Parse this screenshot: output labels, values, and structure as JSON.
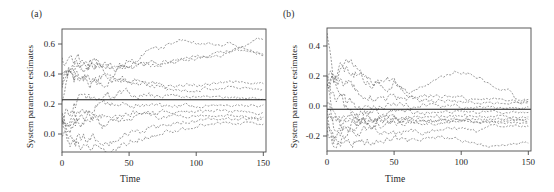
{
  "figure": {
    "background": "#ffffff",
    "trajectory_color": "#5a5a5a",
    "reference_color": "#161616",
    "axis_color": "#4a4a4a"
  },
  "panels": [
    {
      "tag": "(a)",
      "xlabel": "Time",
      "ylabel": "System parameter estimates",
      "xticks": [
        "0",
        "50",
        "100",
        "150"
      ],
      "yticks": [
        "0.0",
        "0.2",
        "0.4",
        "0.6"
      ]
    },
    {
      "tag": "(b)",
      "xlabel": "Time",
      "ylabel": "System parameter estimates",
      "xticks": [
        "0",
        "50",
        "100",
        "150"
      ],
      "yticks": [
        "-0.2",
        "0.0",
        "0.2",
        "0.4"
      ]
    }
  ],
  "chart_data": [
    {
      "type": "line",
      "panel": "(a)",
      "title": "",
      "xlabel": "Time",
      "ylabel": "System parameter estimates",
      "xlim": [
        0,
        152
      ],
      "ylim": [
        -0.12,
        0.7
      ],
      "xticks": [
        0,
        50,
        100,
        150
      ],
      "yticks": [
        0.0,
        0.2,
        0.4,
        0.6
      ],
      "grid": false,
      "legend": "none",
      "reference_line": {
        "style": "solid",
        "orientation": "horizontal",
        "value": 0.228,
        "label": "true system parameter"
      },
      "x": [
        0,
        5,
        10,
        15,
        20,
        25,
        30,
        35,
        40,
        45,
        50,
        55,
        60,
        65,
        70,
        75,
        80,
        85,
        90,
        95,
        100,
        105,
        110,
        115,
        120,
        125,
        130,
        135,
        140,
        145,
        150
      ],
      "series": [
        {
          "name": "estimate-1",
          "style": "dashed",
          "values": [
            0.34,
            0.42,
            0.47,
            0.47,
            0.44,
            0.46,
            0.47,
            0.44,
            0.44,
            0.47,
            0.49,
            0.48,
            0.53,
            0.57,
            0.57,
            0.58,
            0.6,
            0.62,
            0.63,
            0.63,
            0.61,
            0.6,
            0.6,
            0.6,
            0.6,
            0.61,
            0.59,
            0.58,
            0.6,
            0.63,
            0.63
          ]
        },
        {
          "name": "estimate-2",
          "style": "dashed",
          "values": [
            0.52,
            0.51,
            0.5,
            0.5,
            0.47,
            0.47,
            0.46,
            0.45,
            0.45,
            0.46,
            0.45,
            0.45,
            0.46,
            0.46,
            0.46,
            0.47,
            0.48,
            0.48,
            0.49,
            0.5,
            0.5,
            0.51,
            0.52,
            0.52,
            0.53,
            0.54,
            0.55,
            0.55,
            0.55,
            0.54,
            0.53
          ]
        },
        {
          "name": "estimate-3",
          "style": "dashed",
          "values": [
            0.22,
            0.44,
            0.43,
            0.43,
            0.42,
            0.44,
            0.42,
            0.4,
            0.42,
            0.44,
            0.45,
            0.46,
            0.46,
            0.47,
            0.47,
            0.48,
            0.48,
            0.49,
            0.5,
            0.51,
            0.52,
            0.52,
            0.53,
            0.54,
            0.55,
            0.56,
            0.57,
            0.57,
            0.55,
            0.54,
            0.53
          ]
        },
        {
          "name": "estimate-4",
          "style": "dashed",
          "values": [
            0.4,
            0.41,
            0.4,
            0.39,
            0.38,
            0.37,
            0.38,
            0.37,
            0.36,
            0.35,
            0.35,
            0.34,
            0.34,
            0.34,
            0.33,
            0.33,
            0.32,
            0.32,
            0.32,
            0.33,
            0.33,
            0.33,
            0.33,
            0.34,
            0.34,
            0.35,
            0.35,
            0.35,
            0.34,
            0.34,
            0.34
          ]
        },
        {
          "name": "estimate-5",
          "style": "dashed",
          "values": [
            0.3,
            0.35,
            0.36,
            0.36,
            0.35,
            0.34,
            0.34,
            0.35,
            0.36,
            0.37,
            0.36,
            0.35,
            0.34,
            0.33,
            0.32,
            0.31,
            0.3,
            0.3,
            0.29,
            0.29,
            0.29,
            0.3,
            0.3,
            0.3,
            0.3,
            0.31,
            0.31,
            0.31,
            0.3,
            0.3,
            0.29
          ]
        },
        {
          "name": "estimate-6",
          "style": "dashed",
          "values": [
            0.08,
            0.14,
            0.2,
            0.23,
            0.24,
            0.25,
            0.26,
            0.26,
            0.26,
            0.27,
            0.27,
            0.26,
            0.26,
            0.26,
            0.25,
            0.25,
            0.25,
            0.25,
            0.25,
            0.25,
            0.25,
            0.25,
            0.25,
            0.25,
            0.24,
            0.24,
            0.24,
            0.24,
            0.24,
            0.24,
            0.24
          ]
        },
        {
          "name": "estimate-7",
          "style": "dashed",
          "values": [
            0.12,
            0.1,
            0.12,
            0.14,
            0.17,
            0.19,
            0.2,
            0.2,
            0.2,
            0.2,
            0.19,
            0.19,
            0.19,
            0.19,
            0.19,
            0.19,
            0.19,
            0.19,
            0.19,
            0.19,
            0.19,
            0.19,
            0.19,
            0.19,
            0.19,
            0.19,
            0.19,
            0.19,
            0.19,
            0.19,
            0.19
          ]
        },
        {
          "name": "estimate-8",
          "style": "dashed",
          "values": [
            0.05,
            0.07,
            0.08,
            0.09,
            0.11,
            0.12,
            0.12,
            0.11,
            0.11,
            0.12,
            0.13,
            0.14,
            0.14,
            0.14,
            0.14,
            0.15,
            0.15,
            0.15,
            0.15,
            0.15,
            0.15,
            0.15,
            0.15,
            0.15,
            0.15,
            0.15,
            0.15,
            0.15,
            0.15,
            0.14,
            0.14
          ]
        },
        {
          "name": "estimate-9",
          "style": "dashed",
          "values": [
            0.1,
            0.05,
            0.08,
            0.09,
            0.1,
            0.11,
            0.06,
            0.08,
            0.09,
            0.1,
            0.11,
            0.11,
            0.12,
            0.12,
            0.12,
            0.12,
            0.12,
            0.12,
            0.12,
            0.12,
            0.12,
            0.12,
            0.12,
            0.12,
            0.12,
            0.12,
            0.12,
            0.12,
            0.11,
            0.11,
            0.11
          ]
        },
        {
          "name": "estimate-10",
          "style": "dashed",
          "values": [
            0.06,
            -0.04,
            -0.05,
            -0.04,
            -0.03,
            -0.02,
            -0.04,
            -0.05,
            -0.04,
            -0.02,
            0.0,
            0.01,
            0.02,
            0.03,
            0.04,
            0.05,
            0.06,
            0.07,
            0.08,
            0.08,
            0.09,
            0.09,
            0.1,
            0.1,
            0.1,
            0.1,
            0.1,
            0.1,
            0.1,
            0.1,
            0.1
          ]
        },
        {
          "name": "estimate-11",
          "style": "dashed",
          "values": [
            0.03,
            -0.06,
            -0.08,
            -0.09,
            -0.1,
            -0.1,
            -0.11,
            -0.1,
            -0.09,
            -0.07,
            -0.05,
            -0.04,
            -0.03,
            -0.02,
            -0.01,
            0.0,
            0.01,
            0.02,
            0.03,
            0.04,
            0.05,
            0.06,
            0.06,
            0.07,
            0.07,
            0.07,
            0.07,
            0.07,
            0.07,
            0.07,
            0.07
          ]
        }
      ]
    },
    {
      "type": "line",
      "panel": "(b)",
      "title": "",
      "xlabel": "Time",
      "ylabel": "System parameter estimates",
      "xlim": [
        0,
        152
      ],
      "ylim": [
        -0.3,
        0.52
      ],
      "xticks": [
        0,
        50,
        100,
        150
      ],
      "yticks": [
        -0.2,
        0.0,
        0.2,
        0.4
      ],
      "grid": false,
      "legend": "none",
      "reference_line": {
        "style": "solid",
        "orientation": "horizontal",
        "value": -0.022,
        "label": "true system parameter"
      },
      "x": [
        0,
        5,
        10,
        15,
        20,
        25,
        30,
        35,
        40,
        45,
        50,
        55,
        60,
        65,
        70,
        75,
        80,
        85,
        90,
        95,
        100,
        105,
        110,
        115,
        120,
        125,
        130,
        135,
        140,
        145,
        150
      ],
      "series": [
        {
          "name": "estimate-1",
          "style": "dashed",
          "values": [
            0.5,
            0.16,
            0.22,
            0.3,
            0.26,
            0.2,
            0.17,
            0.14,
            0.14,
            0.13,
            0.16,
            0.12,
            0.09,
            0.09,
            0.11,
            0.15,
            0.18,
            0.2,
            0.22,
            0.23,
            0.22,
            0.22,
            0.2,
            0.18,
            0.15,
            0.12,
            0.1,
            0.12,
            0.05,
            0.04,
            0.04
          ]
        },
        {
          "name": "estimate-2",
          "style": "dashed",
          "values": [
            0.17,
            0.19,
            0.25,
            0.26,
            0.21,
            0.22,
            0.2,
            0.16,
            0.15,
            0.17,
            0.16,
            0.12,
            0.09,
            0.06,
            0.06,
            0.07,
            0.07,
            0.07,
            0.07,
            0.06,
            0.06,
            0.05,
            0.05,
            0.05,
            0.05,
            0.05,
            0.04,
            0.04,
            0.04,
            0.03,
            0.03
          ]
        },
        {
          "name": "estimate-3",
          "style": "dashed",
          "values": [
            0.15,
            0.18,
            0.15,
            0.14,
            0.12,
            0.09,
            0.07,
            0.06,
            0.05,
            0.05,
            0.05,
            0.05,
            0.05,
            0.05,
            0.04,
            0.04,
            0.03,
            0.03,
            0.03,
            0.03,
            0.03,
            0.03,
            0.02,
            0.02,
            0.02,
            0.02,
            0.02,
            0.02,
            0.02,
            0.02,
            0.02
          ]
        },
        {
          "name": "estimate-4",
          "style": "dashed",
          "values": [
            0.2,
            0.08,
            0.04,
            0.02,
            0.01,
            0.0,
            -0.01,
            -0.01,
            -0.01,
            0.0,
            0.0,
            0.0,
            0.0,
            0.0,
            0.0,
            0.0,
            0.0,
            0.0,
            0.0,
            0.0,
            -0.01,
            -0.01,
            -0.01,
            -0.01,
            -0.01,
            -0.01,
            -0.01,
            -0.01,
            -0.01,
            -0.01,
            -0.01
          ]
        },
        {
          "name": "estimate-5",
          "style": "dashed",
          "values": [
            0.14,
            -0.05,
            -0.07,
            -0.06,
            -0.05,
            -0.04,
            -0.04,
            -0.04,
            -0.04,
            -0.04,
            -0.04,
            -0.04,
            -0.04,
            -0.04,
            -0.04,
            -0.04,
            -0.04,
            -0.04,
            -0.04,
            -0.04,
            -0.04,
            -0.04,
            -0.04,
            -0.04,
            -0.04,
            -0.04,
            -0.04,
            -0.04,
            -0.04,
            -0.04,
            -0.04
          ]
        },
        {
          "name": "estimate-6",
          "style": "dashed",
          "values": [
            0.0,
            -0.1,
            -0.12,
            -0.1,
            -0.08,
            -0.08,
            -0.08,
            -0.08,
            -0.08,
            -0.08,
            -0.08,
            -0.08,
            -0.08,
            -0.08,
            -0.07,
            -0.07,
            -0.07,
            -0.07,
            -0.07,
            -0.07,
            -0.07,
            -0.07,
            -0.07,
            -0.07,
            -0.07,
            -0.07,
            -0.07,
            -0.07,
            -0.07,
            -0.07,
            -0.07
          ]
        },
        {
          "name": "estimate-7",
          "style": "dashed",
          "values": [
            -0.05,
            -0.14,
            -0.13,
            -0.12,
            -0.11,
            -0.1,
            -0.1,
            -0.09,
            -0.09,
            -0.09,
            -0.09,
            -0.09,
            -0.09,
            -0.09,
            -0.09,
            -0.09,
            -0.09,
            -0.09,
            -0.09,
            -0.09,
            -0.09,
            -0.09,
            -0.09,
            -0.09,
            -0.09,
            -0.09,
            -0.09,
            -0.09,
            -0.09,
            -0.09,
            -0.09
          ]
        },
        {
          "name": "estimate-8",
          "style": "dashed",
          "values": [
            -0.1,
            -0.2,
            -0.18,
            -0.16,
            -0.14,
            -0.13,
            -0.12,
            -0.12,
            -0.12,
            -0.12,
            -0.12,
            -0.12,
            -0.11,
            -0.11,
            -0.11,
            -0.11,
            -0.11,
            -0.11,
            -0.11,
            -0.11,
            -0.11,
            -0.11,
            -0.11,
            -0.11,
            -0.11,
            -0.11,
            -0.11,
            -0.11,
            -0.11,
            -0.11,
            -0.11
          ]
        },
        {
          "name": "estimate-9",
          "style": "dashed",
          "values": [
            -0.15,
            -0.24,
            -0.22,
            -0.2,
            -0.18,
            -0.17,
            -0.16,
            -0.16,
            -0.18,
            -0.19,
            -0.19,
            -0.18,
            -0.17,
            -0.17,
            -0.18,
            -0.18,
            -0.17,
            -0.16,
            -0.15,
            -0.15,
            -0.15,
            -0.16,
            -0.17,
            -0.16,
            -0.14,
            -0.13,
            -0.13,
            -0.13,
            -0.13,
            -0.13,
            -0.13
          ]
        },
        {
          "name": "estimate-10",
          "style": "dashed",
          "values": [
            -0.18,
            -0.26,
            -0.25,
            -0.25,
            -0.24,
            -0.24,
            -0.24,
            -0.24,
            -0.23,
            -0.22,
            -0.22,
            -0.22,
            -0.23,
            -0.23,
            -0.23,
            -0.22,
            -0.21,
            -0.21,
            -0.21,
            -0.22,
            -0.23,
            -0.24,
            -0.25,
            -0.26,
            -0.27,
            -0.27,
            -0.27,
            -0.26,
            -0.25,
            -0.24,
            -0.24
          ]
        },
        {
          "name": "estimate-11",
          "style": "dashed",
          "values": [
            0.18,
            0.13,
            0.1,
            -0.02,
            -0.06,
            -0.09,
            -0.1,
            -0.1,
            -0.1,
            -0.1,
            -0.1,
            -0.1,
            -0.1,
            -0.1,
            -0.1,
            -0.1,
            -0.1,
            -0.1,
            -0.1,
            -0.1,
            -0.1,
            -0.1,
            -0.1,
            -0.1,
            -0.1,
            -0.1,
            -0.1,
            -0.1,
            -0.1,
            -0.1,
            -0.1
          ]
        }
      ]
    }
  ]
}
